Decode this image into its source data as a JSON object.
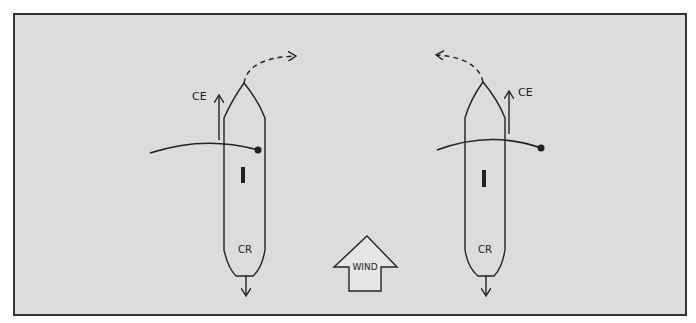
{
  "figure": {
    "background": "#dcdcdc",
    "ink": "#222222",
    "left_boat": {
      "ce_label": "CE",
      "cr_label": "CR",
      "rudder_mark": "I",
      "turn_direction": "right"
    },
    "right_boat": {
      "ce_label": "CE",
      "cr_label": "CR",
      "rudder_mark": "I",
      "turn_direction": "left"
    },
    "wind_arrow": {
      "label": "WIND",
      "direction": "up"
    }
  }
}
